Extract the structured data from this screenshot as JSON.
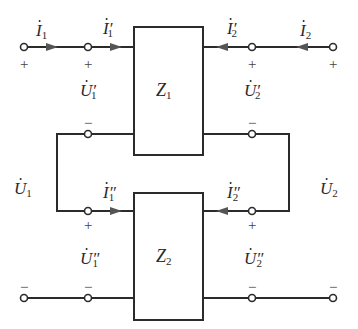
{
  "diagram": {
    "type": "two-port series connection",
    "colors": {
      "wire": "#2b2b2b",
      "arrow": "#555555",
      "text": "#2a2a2a"
    },
    "networks": [
      {
        "id": "Z1",
        "symbol": "Z",
        "subscript": "1"
      },
      {
        "id": "Z2",
        "symbol": "Z",
        "subscript": "2"
      }
    ],
    "currents": {
      "I1": {
        "symbol": "I",
        "subscript": "1",
        "prime": ""
      },
      "I1p": {
        "symbol": "I",
        "subscript": "1",
        "prime": "′"
      },
      "I2p": {
        "symbol": "I",
        "subscript": "2",
        "prime": "′"
      },
      "I2": {
        "symbol": "I",
        "subscript": "2",
        "prime": ""
      },
      "I1pp": {
        "symbol": "I",
        "subscript": "1",
        "prime": "″"
      },
      "I2pp": {
        "symbol": "I",
        "subscript": "2",
        "prime": "″"
      }
    },
    "voltages": {
      "U1p": {
        "symbol": "U",
        "subscript": "1",
        "prime": "′"
      },
      "U2p": {
        "symbol": "U",
        "subscript": "2",
        "prime": "′"
      },
      "U1": {
        "symbol": "U",
        "subscript": "1",
        "prime": ""
      },
      "U2": {
        "symbol": "U",
        "subscript": "2",
        "prime": ""
      },
      "U1pp": {
        "symbol": "U",
        "subscript": "1",
        "prime": "″"
      },
      "U2pp": {
        "symbol": "U",
        "subscript": "2",
        "prime": "″"
      }
    },
    "signs": {
      "plus": "+",
      "minus": "−"
    }
  }
}
